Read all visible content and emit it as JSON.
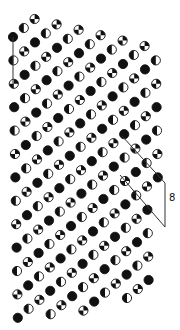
{
  "figure": {
    "background": "#ffffff",
    "ink": "#111111",
    "atom_radius": 4.6
  },
  "lattice": {
    "origin": [
      13,
      37
    ],
    "v1": [
      0.4,
      23.4
    ],
    "v2": [
      11.2,
      14.4
    ],
    "i_range": [
      -12,
      14
    ],
    "j_range": [
      0,
      13
    ],
    "type_rule": "(i + 2*j) mod 3",
    "types": [
      "black",
      "half",
      "quarter"
    ],
    "bounds": {
      "polygon": [
        [
          8,
          30
        ],
        [
          35,
          12
        ],
        [
          152,
          38
        ],
        [
          158,
          44
        ],
        [
          158,
          292
        ],
        [
          150,
          300
        ],
        [
          40,
          322
        ],
        [
          8,
          318
        ]
      ]
    }
  },
  "atom_types": {
    "black": {
      "name": "solid atom",
      "fill": "#111111"
    },
    "half": {
      "name": "half-filled atom (left half dark)",
      "fill": "#111111"
    },
    "quarter": {
      "name": "quartered atom (checkered)",
      "fill": "#111111"
    }
  },
  "annotations": {
    "left_column_line": {
      "points": [
        [
          13,
          37
        ],
        [
          13,
          84
        ]
      ]
    },
    "cell_outline": {
      "top_edge": [
        [
          122,
          136
        ],
        [
          165,
          183
        ]
      ],
      "right_edge": [
        [
          165,
          183
        ],
        [
          165,
          227
        ]
      ],
      "bottom_edge": [
        [
          120,
          175
        ],
        [
          165,
          227
        ]
      ]
    },
    "symbol": {
      "text": "8",
      "x": 169,
      "y": 201
    }
  }
}
